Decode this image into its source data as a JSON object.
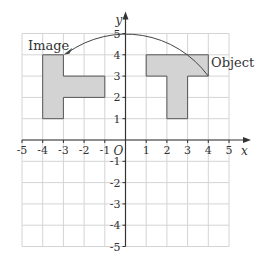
{
  "diagram": {
    "type": "coordinate-grid-rotation",
    "axes": {
      "x_label": "x",
      "y_label": "y",
      "origin_label": "O",
      "x_range": [
        -5,
        5
      ],
      "y_range": [
        -5,
        5
      ],
      "x_ticks": [
        "-5",
        "-4",
        "-3",
        "-2",
        "-1",
        "1",
        "2",
        "3",
        "4",
        "5"
      ],
      "y_ticks": [
        "5",
        "4",
        "3",
        "2",
        "1",
        "-1",
        "-2",
        "-3",
        "-4",
        "-5"
      ],
      "grid": true
    },
    "labels": {
      "image": "Image",
      "object": "Object"
    },
    "shapes": {
      "object": {
        "name": "Object",
        "polygon": [
          [
            1,
            4
          ],
          [
            4,
            4
          ],
          [
            4,
            3
          ],
          [
            3,
            3
          ],
          [
            3,
            1
          ],
          [
            2,
            1
          ],
          [
            2,
            3
          ],
          [
            1,
            3
          ]
        ]
      },
      "image": {
        "name": "Image",
        "polygon": [
          [
            -4,
            4
          ],
          [
            -3,
            4
          ],
          [
            -3,
            3
          ],
          [
            -1,
            3
          ],
          [
            -1,
            2
          ],
          [
            -3,
            2
          ],
          [
            -3,
            1
          ],
          [
            -4,
            1
          ]
        ]
      }
    },
    "arc": {
      "from": [
        4,
        3
      ],
      "to": [
        -3,
        4
      ],
      "center": [
        0,
        0
      ],
      "radius": 5,
      "direction": "anticlockwise",
      "arrowhead_at": "to"
    },
    "colors": {
      "grid": "#d4d4d4",
      "axis": "#333333",
      "shape_fill": "#d3d3d3",
      "shape_stroke": "#555555",
      "arc": "#444444"
    }
  }
}
